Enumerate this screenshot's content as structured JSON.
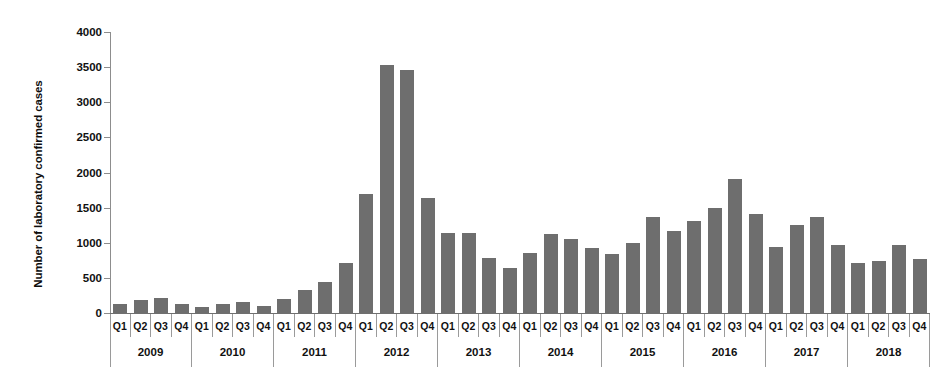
{
  "chart_data": {
    "type": "bar",
    "title": "",
    "subtitle": "",
    "xlabel": "",
    "ylabel": "Number of laboratory confirmed cases",
    "ylim": [
      0,
      4000
    ],
    "ytick_labels": [
      "4000",
      "3500",
      "3000",
      "2500",
      "2000",
      "1500",
      "1000",
      "500",
      "0"
    ],
    "yticks": [
      4000,
      3500,
      3000,
      2500,
      2000,
      1500,
      1000,
      500,
      0
    ],
    "grid": false,
    "legend": "none",
    "bar_color": "#6e6e6e",
    "quarter_labels": [
      "Q1",
      "Q2",
      "Q3",
      "Q4"
    ],
    "years": [
      "2009",
      "2010",
      "2011",
      "2012",
      "2013",
      "2014",
      "2015",
      "2016",
      "2017",
      "2018"
    ],
    "categories": [
      "2009 Q1",
      "2009 Q2",
      "2009 Q3",
      "2009 Q4",
      "2010 Q1",
      "2010 Q2",
      "2010 Q3",
      "2010 Q4",
      "2011 Q1",
      "2011 Q2",
      "2011 Q3",
      "2011 Q4",
      "2012 Q1",
      "2012 Q2",
      "2012 Q3",
      "2012 Q4",
      "2013 Q1",
      "2013 Q2",
      "2013 Q3",
      "2013 Q4",
      "2014 Q1",
      "2014 Q2",
      "2014 Q3",
      "2014 Q4",
      "2015 Q1",
      "2015 Q2",
      "2015 Q3",
      "2015 Q4",
      "2016 Q1",
      "2016 Q2",
      "2016 Q3",
      "2016 Q4",
      "2017 Q1",
      "2017 Q2",
      "2017 Q3",
      "2017 Q4",
      "2018 Q1",
      "2018 Q2",
      "2018 Q3",
      "2018 Q4"
    ],
    "values": [
      130,
      185,
      215,
      130,
      80,
      130,
      150,
      105,
      195,
      330,
      440,
      715,
      1700,
      3530,
      3465,
      1640,
      1140,
      1145,
      790,
      640,
      850,
      1120,
      1055,
      930,
      835,
      990,
      1360,
      1165,
      1310,
      1490,
      1910,
      1415,
      940,
      1255,
      1370,
      975,
      710,
      745,
      965,
      775
    ]
  }
}
